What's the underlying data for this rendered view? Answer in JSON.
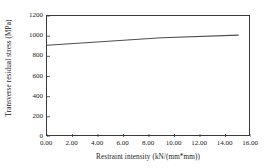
{
  "chart_data": {
    "type": "line",
    "title": "",
    "xlabel": "Restraint intensity (kN/(mm*mm))",
    "ylabel": "Transverse residual stress (MPa)",
    "xlim": [
      0,
      16
    ],
    "ylim": [
      0,
      1200
    ],
    "xticks": [
      "0.00",
      "2.00",
      "4.00",
      "6.00",
      "8.00",
      "10.00",
      "12.00",
      "14.00",
      "16.00"
    ],
    "xtick_values": [
      0,
      2,
      4,
      6,
      8,
      10,
      12,
      14,
      16
    ],
    "yticks": [
      "0",
      "200",
      "400",
      "600",
      "800",
      "1000",
      "1200"
    ],
    "ytick_values": [
      0,
      200,
      400,
      600,
      800,
      1000,
      1200
    ],
    "grid": false,
    "legend": false,
    "series": [
      {
        "name": "Transverse residual stress",
        "color": "#4d4d4d",
        "x": [
          0,
          9,
          15
        ],
        "values": [
          910,
          985,
          1010
        ]
      }
    ]
  }
}
